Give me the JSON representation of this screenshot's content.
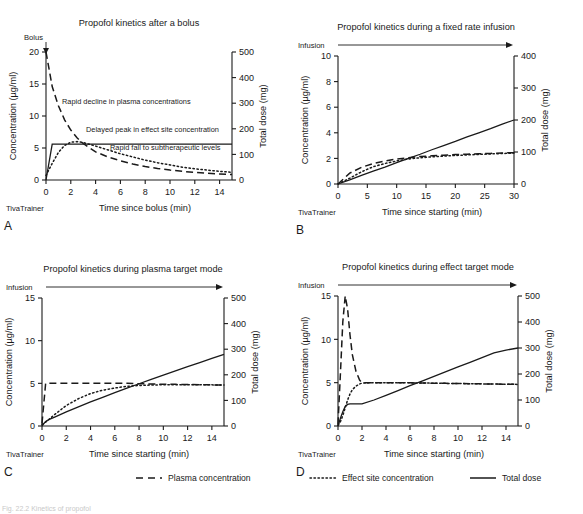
{
  "figure": {
    "watermark": "TivaTrainer",
    "caption_partial": "Fig. 22.2 Kinetics of propofol"
  },
  "legend": {
    "items": [
      {
        "label": "Plasma concentration",
        "style": "dashed"
      },
      {
        "label": "Effect site concentration",
        "style": "dotted"
      },
      {
        "label": "Total dose",
        "style": "solid"
      }
    ]
  },
  "chart_data": [
    {
      "id": "A",
      "panel_label": "A",
      "type": "line",
      "title": "Propofol kinetics after a bolus",
      "xlabel": "Time since bolus (min)",
      "ylabel": "Concentration (µg/ml)",
      "y2label": "Total dose (mg)",
      "xlim": [
        0,
        15
      ],
      "ylim": [
        0,
        20
      ],
      "y2lim": [
        0,
        500
      ],
      "xticks": [
        0,
        2,
        4,
        6,
        8,
        10,
        12,
        14
      ],
      "yticks": [
        0,
        5,
        10,
        15,
        20
      ],
      "y2ticks": [
        0,
        100,
        200,
        300,
        400,
        500
      ],
      "grid": false,
      "event_label": "Bolus",
      "event_marker": "down-arrow",
      "annotations": [
        "Rapid decline in plasma concentrations",
        "Delayed peak in effect site concentration",
        "Rapid fall to subtherapeutic levels"
      ],
      "x": [
        0,
        0.5,
        1,
        1.5,
        2,
        2.5,
        3,
        4,
        5,
        6,
        7,
        8,
        9,
        10,
        11,
        12,
        13,
        14,
        15
      ],
      "series": [
        {
          "name": "Plasma concentration",
          "style": "dashed",
          "axis": "left",
          "values": [
            20,
            14.6,
            11.6,
            9.4,
            7.8,
            6.6,
            5.7,
            4.4,
            3.6,
            3.0,
            2.5,
            2.1,
            1.8,
            1.55,
            1.35,
            1.2,
            1.05,
            0.95,
            0.85
          ]
        },
        {
          "name": "Effect site concentration",
          "style": "dotted",
          "axis": "left",
          "values": [
            0.7,
            2.6,
            4.3,
            5.4,
            5.9,
            6.0,
            5.85,
            5.3,
            4.7,
            4.1,
            3.6,
            3.1,
            2.7,
            2.35,
            2.0,
            1.75,
            1.55,
            1.35,
            1.2
          ]
        },
        {
          "name": "Total dose",
          "style": "solid",
          "axis": "right",
          "values": [
            0,
            140,
            140,
            140,
            140,
            140,
            140,
            140,
            140,
            140,
            140,
            140,
            140,
            140,
            140,
            140,
            140,
            140,
            140
          ]
        }
      ]
    },
    {
      "id": "B",
      "panel_label": "B",
      "type": "line",
      "title": "Propofol kinetics during a fixed rate infusion",
      "xlabel": "Time since starting (min)",
      "ylabel": "Concentration (µg/ml)",
      "y2label": "Total dose (mg)",
      "xlim": [
        0,
        30
      ],
      "ylim": [
        0,
        10
      ],
      "y2lim": [
        0,
        400
      ],
      "xticks": [
        0,
        5,
        10,
        15,
        20,
        25,
        30
      ],
      "yticks": [
        0,
        2,
        4,
        6,
        8,
        10
      ],
      "y2ticks": [
        0,
        100,
        200,
        300,
        400
      ],
      "grid": false,
      "event_label": "Infusion",
      "event_marker": "right-arrow",
      "annotations": [],
      "x": [
        0,
        2,
        4,
        6,
        8,
        10,
        12,
        14,
        16,
        18,
        20,
        22,
        24,
        26,
        28,
        30
      ],
      "series": [
        {
          "name": "Plasma concentration",
          "style": "dashed",
          "axis": "left",
          "values": [
            0,
            0.85,
            1.3,
            1.6,
            1.8,
            1.95,
            2.05,
            2.15,
            2.2,
            2.25,
            2.3,
            2.33,
            2.36,
            2.39,
            2.42,
            2.45
          ]
        },
        {
          "name": "Effect site concentration",
          "style": "dotted",
          "axis": "left",
          "values": [
            0,
            0.45,
            0.95,
            1.35,
            1.6,
            1.8,
            1.95,
            2.05,
            2.12,
            2.18,
            2.23,
            2.27,
            2.31,
            2.35,
            2.38,
            2.42
          ]
        },
        {
          "name": "Total dose",
          "style": "solid",
          "axis": "right",
          "values": [
            0,
            13,
            27,
            40,
            53,
            67,
            80,
            93,
            107,
            120,
            133,
            147,
            160,
            173,
            187,
            200
          ]
        }
      ]
    },
    {
      "id": "C",
      "panel_label": "C",
      "type": "line",
      "title": "Propofol kinetics during plasma target mode",
      "xlabel": "Time since starting (min)",
      "ylabel": "Concentration (µg/ml)",
      "y2label": "Total dose (mg)",
      "xlim": [
        0,
        15
      ],
      "ylim": [
        0,
        15
      ],
      "y2lim": [
        0,
        500
      ],
      "xticks": [
        0,
        2,
        4,
        6,
        8,
        10,
        12,
        14
      ],
      "yticks": [
        0,
        5,
        10,
        15
      ],
      "y2ticks": [
        0,
        100,
        200,
        300,
        400,
        500
      ],
      "grid": false,
      "event_label": "Infusion",
      "event_marker": "right-arrow",
      "annotations": [],
      "x": [
        0,
        0.3,
        0.6,
        1,
        2,
        3,
        4,
        5,
        6,
        7,
        8,
        9,
        10,
        11,
        12,
        13,
        14,
        15
      ],
      "series": [
        {
          "name": "Plasma concentration",
          "style": "dashed",
          "axis": "left",
          "values": [
            0.3,
            5.0,
            5.0,
            5.0,
            5.0,
            5.0,
            5.0,
            5.0,
            5.0,
            5.0,
            4.95,
            4.92,
            4.9,
            4.88,
            4.86,
            4.84,
            4.82,
            4.8
          ]
        },
        {
          "name": "Effect site concentration",
          "style": "dotted",
          "axis": "left",
          "values": [
            0.2,
            0.45,
            0.8,
            1.3,
            2.4,
            3.2,
            3.8,
            4.2,
            4.45,
            4.65,
            4.75,
            4.8,
            4.83,
            4.84,
            4.84,
            4.83,
            4.82,
            4.8
          ]
        },
        {
          "name": "Total dose",
          "style": "solid",
          "axis": "right",
          "values": [
            0,
            18,
            26,
            34,
            55,
            75,
            94,
            112,
            130,
            148,
            165,
            182,
            199,
            215,
            232,
            248,
            264,
            280
          ]
        }
      ]
    },
    {
      "id": "D",
      "panel_label": "D",
      "type": "line",
      "title": "Propofol kinetics during effect target mode",
      "xlabel": "Time since starting (min)",
      "ylabel": "Concentration (µg/ml)",
      "y2label": "Total dose (mg)",
      "xlim": [
        0,
        15
      ],
      "ylim": [
        0,
        15
      ],
      "y2lim": [
        0,
        500
      ],
      "xticks": [
        0,
        2,
        4,
        6,
        8,
        10,
        12,
        14
      ],
      "yticks": [
        0,
        5,
        10,
        15
      ],
      "y2ticks": [
        0,
        100,
        200,
        300,
        400,
        500
      ],
      "grid": false,
      "event_label": "Infusion",
      "event_marker": "right-arrow",
      "annotations": [],
      "x": [
        0,
        0.2,
        0.4,
        0.6,
        0.8,
        1,
        1.2,
        1.5,
        1.8,
        2,
        3,
        4,
        5,
        6,
        7,
        8,
        9,
        10,
        11,
        12,
        13,
        14,
        15
      ],
      "series": [
        {
          "name": "Plasma concentration",
          "style": "dashed",
          "axis": "left",
          "values": [
            0.2,
            6.0,
            12.0,
            15.0,
            13.5,
            10.5,
            8.2,
            6.3,
            5.3,
            5.0,
            5.0,
            5.0,
            5.0,
            4.98,
            4.96,
            4.94,
            4.92,
            4.9,
            4.88,
            4.86,
            4.84,
            4.82,
            4.8
          ]
        },
        {
          "name": "Effect site concentration",
          "style": "dotted",
          "axis": "left",
          "values": [
            0.1,
            0.5,
            1.2,
            2.1,
            3.0,
            3.7,
            4.2,
            4.6,
            4.85,
            4.95,
            5.0,
            5.0,
            5.0,
            4.98,
            4.96,
            4.94,
            4.92,
            4.9,
            4.88,
            4.86,
            4.84,
            4.82,
            4.8
          ]
        },
        {
          "name": "Total dose",
          "style": "solid",
          "axis": "right",
          "values": [
            0,
            30,
            55,
            75,
            83,
            85,
            85,
            85,
            85,
            85,
            100,
            118,
            136,
            155,
            173,
            191,
            209,
            227,
            245,
            263,
            281,
            292,
            300
          ]
        }
      ]
    }
  ]
}
